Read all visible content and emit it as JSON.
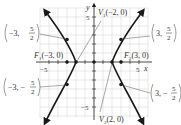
{
  "diagram": {
    "type": "hyperbola-graph",
    "equation_implied": "x^2/4 - y^2/5 = 1",
    "axes": {
      "x_label": "x",
      "y_label": "y",
      "tick_labels": {
        "x_neg": "−5",
        "x_pos": "5",
        "y_pos": "5",
        "y_neg": "−5"
      },
      "range": {
        "x": [
          -6,
          6
        ],
        "y": [
          -6,
          6
        ]
      }
    },
    "points": {
      "v1": {
        "label_prefix": "V",
        "sub": "1",
        "coords": "(−2, 0)",
        "x": -2,
        "y": 0
      },
      "v2": {
        "label_prefix": "V",
        "sub": "2",
        "coords": "(2, 0)",
        "x": 2,
        "y": 0
      },
      "f1": {
        "label_prefix": "F",
        "sub": "1",
        "coords": "(−3, 0)",
        "x": -3,
        "y": 0
      },
      "f2": {
        "label_prefix": "F",
        "sub": "2",
        "coords": "(3, 0)",
        "x": 3,
        "y": 0
      },
      "p_ul": {
        "left": "−3,",
        "num": "5",
        "den": "2",
        "x": -3,
        "y": 2.5
      },
      "p_ur": {
        "left": "3,",
        "num": "5",
        "den": "2",
        "x": 3,
        "y": 2.5
      },
      "p_ll": {
        "left": "−3, −",
        "num": "5",
        "den": "2",
        "x": -3,
        "y": -2.5
      },
      "p_lr": {
        "left": "3, −",
        "num": "5",
        "den": "2",
        "x": 3,
        "y": -2.5
      }
    },
    "colors": {
      "curve": "#1a1a1a",
      "grid": "#d9d9d9",
      "axis": "#333333"
    }
  }
}
